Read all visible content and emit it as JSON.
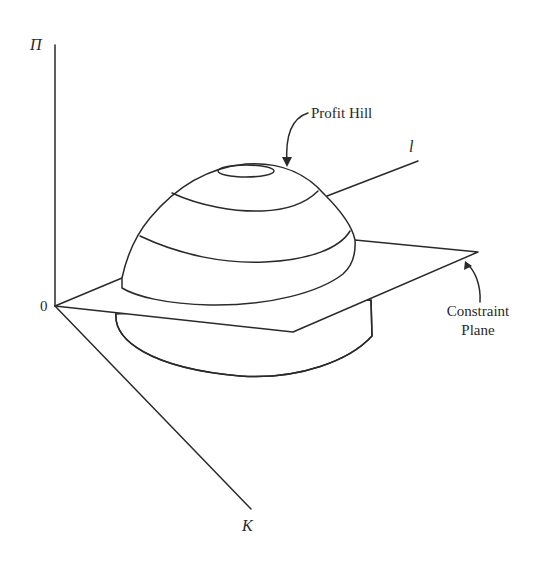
{
  "diagram": {
    "type": "3d-surface-illustration",
    "axes": {
      "vertical": {
        "label": "Π"
      },
      "right": {
        "label": "l"
      },
      "front": {
        "label": "K"
      },
      "origin": {
        "label": "0"
      }
    },
    "annotations": {
      "profit_hill": "Profit Hill",
      "constraint_line1": "Constraint",
      "constraint_line2": "Plane"
    },
    "colors": {
      "stroke": "#2a2a2a",
      "background": "#ffffff"
    }
  }
}
